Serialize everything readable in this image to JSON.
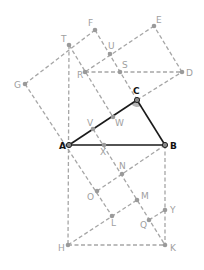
{
  "diagram": {
    "colors": {
      "dashed": "#a6a6a6",
      "solid": "#1a1a1a",
      "label_gray": "#a0a0a0",
      "label_dark": "#111111",
      "angle_fill": "#b5b5b5"
    },
    "points": {
      "A": {
        "x": 69,
        "y": 145,
        "label": "A",
        "lx": -10,
        "ly": 4,
        "style": "dark"
      },
      "B": {
        "x": 165,
        "y": 145,
        "label": "B",
        "lx": 5,
        "ly": 4,
        "style": "dark"
      },
      "C": {
        "x": 137,
        "y": 100,
        "label": "C",
        "lx": -4,
        "ly": -6,
        "style": "dark"
      },
      "D": {
        "x": 182,
        "y": 72,
        "label": "D",
        "lx": 4,
        "ly": 4,
        "style": "gray"
      },
      "E": {
        "x": 154,
        "y": 26,
        "label": "E",
        "lx": 2,
        "ly": -3,
        "style": "gray"
      },
      "F": {
        "x": 95,
        "y": 30,
        "label": "F",
        "lx": -7,
        "ly": -4,
        "style": "gray"
      },
      "G": {
        "x": 25,
        "y": 84,
        "label": "G",
        "lx": -11,
        "ly": 4,
        "style": "gray"
      },
      "T": {
        "x": 69,
        "y": 45,
        "label": "T",
        "lx": -8,
        "ly": -3,
        "style": "gray"
      },
      "U": {
        "x": 110,
        "y": 54,
        "label": "U",
        "lx": -2,
        "ly": -5,
        "style": "gray"
      },
      "S": {
        "x": 120,
        "y": 72,
        "label": "S",
        "lx": 2,
        "ly": -4,
        "style": "gray"
      },
      "R": {
        "x": 85,
        "y": 72,
        "label": "R",
        "lx": -8,
        "ly": 6,
        "style": "gray"
      },
      "W": {
        "x": 113,
        "y": 117,
        "label": "W",
        "lx": 2,
        "ly": 9,
        "style": "gray"
      },
      "V": {
        "x": 93,
        "y": 129,
        "label": "V",
        "lx": -6,
        "ly": -3,
        "style": "gray"
      },
      "X": {
        "x": 104,
        "y": 145,
        "label": "X",
        "lx": -4,
        "ly": 10,
        "style": "gray"
      },
      "N": {
        "x": 122,
        "y": 174,
        "label": "N",
        "lx": -3,
        "ly": -5,
        "style": "gray"
      },
      "O": {
        "x": 97,
        "y": 191,
        "label": "O",
        "lx": -10,
        "ly": 9,
        "style": "gray"
      },
      "M": {
        "x": 137,
        "y": 200,
        "label": "M",
        "lx": 4,
        "ly": -1,
        "style": "gray"
      },
      "L": {
        "x": 112,
        "y": 216,
        "label": "L",
        "lx": -1,
        "ly": 10,
        "style": "gray"
      },
      "Q": {
        "x": 149,
        "y": 220,
        "label": "Q",
        "lx": -9,
        "ly": 8,
        "style": "gray"
      },
      "Y": {
        "x": 165,
        "y": 210,
        "label": "Y",
        "lx": 5,
        "ly": 3,
        "style": "gray"
      },
      "H": {
        "x": 68,
        "y": 245,
        "label": "H",
        "lx": -10,
        "ly": 6,
        "style": "gray"
      },
      "K": {
        "x": 165,
        "y": 245,
        "label": "K",
        "lx": 5,
        "ly": 6,
        "style": "gray"
      }
    },
    "solid_segments": [
      [
        "A",
        "B"
      ],
      [
        "B",
        "C"
      ],
      [
        "C",
        "A"
      ]
    ],
    "dashed_segments": [
      [
        "G",
        "F"
      ],
      [
        "F",
        "C"
      ],
      [
        "C",
        "D"
      ],
      [
        "D",
        "E"
      ],
      [
        "E",
        "R"
      ],
      [
        "R",
        "D"
      ],
      [
        "T",
        "W"
      ],
      [
        "G",
        "L"
      ],
      [
        "T",
        "H"
      ],
      [
        "H",
        "K"
      ],
      [
        "B",
        "K"
      ],
      [
        "B",
        "O"
      ],
      [
        "H",
        "M"
      ],
      [
        "V",
        "K"
      ],
      [
        "Q",
        "Y"
      ]
    ],
    "right_angle_at": "C"
  }
}
